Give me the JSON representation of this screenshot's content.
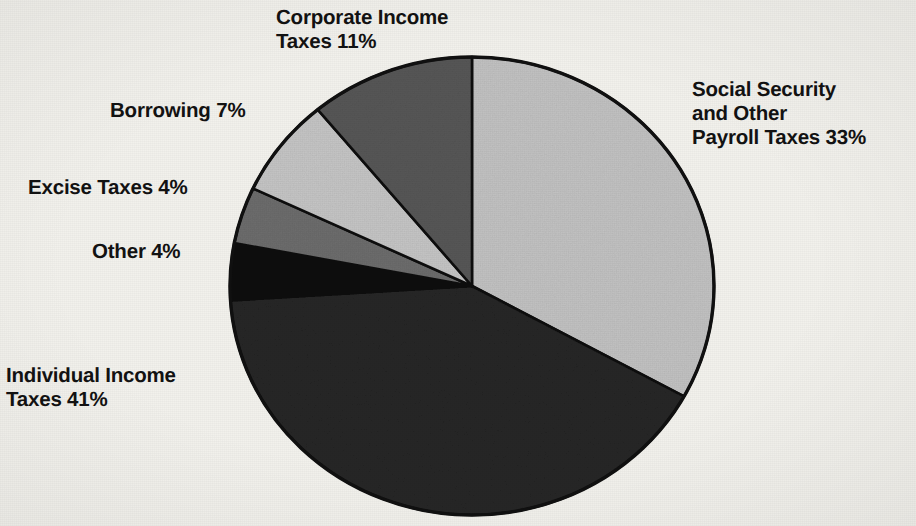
{
  "chart_data": {
    "type": "pie",
    "title": "",
    "subtitle": "",
    "xlabel": "",
    "ylabel": "",
    "legend_position": "none",
    "grid": false,
    "units": "percent",
    "total": 100,
    "start_angle_deg": 0,
    "direction": "clockwise",
    "categories": [
      "Social Security and Other Payroll Taxes",
      "Individual Income Taxes",
      "Other",
      "Excise Taxes",
      "Borrowing",
      "Corporate Income Taxes"
    ],
    "values": [
      33,
      41,
      4,
      4,
      7,
      11
    ],
    "slices": [
      {
        "name": "social-security-payroll-taxes",
        "label": "Social Security\nand Other\nPayroll Taxes 33%",
        "value": 33,
        "value_text": "33%",
        "color": "#c3c3c3",
        "start_deg": 0,
        "end_deg": 118.8
      },
      {
        "name": "individual-income-taxes",
        "label": "Individual Income\nTaxes 41%",
        "value": 41,
        "value_text": "41%",
        "color": "#262626",
        "start_deg": 118.8,
        "end_deg": 266.4
      },
      {
        "name": "other",
        "label": "Other 4%",
        "value": 4,
        "value_text": "4%",
        "color": "#0e0e0e",
        "start_deg": 266.4,
        "end_deg": 280.8
      },
      {
        "name": "excise-taxes",
        "label": "Excise Taxes 4%",
        "value": 4,
        "value_text": "4%",
        "color": "#6d6d6d",
        "start_deg": 280.8,
        "end_deg": 295.2
      },
      {
        "name": "borrowing",
        "label": "Borrowing 7%",
        "value": 7,
        "value_text": "7%",
        "color": "#c6c6c6",
        "start_deg": 295.2,
        "end_deg": 320.4
      },
      {
        "name": "corporate-income-taxes",
        "label": "Corporate Income\nTaxes 11%",
        "value": 11,
        "value_text": "11%",
        "color": "#575757",
        "start_deg": 320.4,
        "end_deg": 360
      }
    ]
  },
  "labels": {
    "corporate_income": "Corporate Income\nTaxes 11%",
    "borrowing": "Borrowing 7%",
    "excise_taxes": "Excise Taxes 4%",
    "other": "Other 4%",
    "individual_income": "Individual Income\nTaxes 41%",
    "social_security": "Social Security\nand Other\nPayroll Taxes 33%"
  },
  "style": {
    "background": "#f2f1ec",
    "outline": "#101010",
    "text": "#121212"
  }
}
